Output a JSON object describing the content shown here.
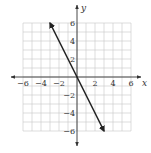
{
  "chart_data": {
    "type": "line",
    "title": "",
    "xlabel": "x",
    "ylabel": "y",
    "xlim": [
      -6,
      6
    ],
    "ylim": [
      -6,
      6
    ],
    "grid": true,
    "x_ticks": [
      -6,
      -4,
      -2,
      2,
      4,
      6
    ],
    "y_ticks": [
      6,
      4,
      2,
      -2,
      -4,
      -6
    ],
    "x_tick_labels": [
      "−6",
      "−4",
      "−2",
      "2",
      "4",
      "6"
    ],
    "y_tick_labels": [
      "6",
      "4",
      "2",
      "−2",
      "−4",
      "−6"
    ],
    "series": [
      {
        "name": "y = -2x",
        "x": [
          -3,
          3
        ],
        "y": [
          6,
          -6
        ],
        "arrows": "both",
        "color": "#222222"
      }
    ]
  },
  "colors": {
    "grid": "#c8c8c8",
    "axis": "#333333",
    "line": "#222222"
  }
}
